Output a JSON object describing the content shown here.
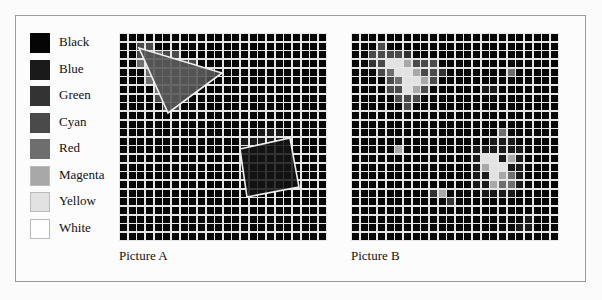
{
  "legend": {
    "items": [
      {
        "label": "Black",
        "color": "#050505"
      },
      {
        "label": "Blue",
        "color": "#1a1a1a"
      },
      {
        "label": "Green",
        "color": "#333333"
      },
      {
        "label": "Cyan",
        "color": "#4a4a4a"
      },
      {
        "label": "Red",
        "color": "#6e6e6e"
      },
      {
        "label": "Magenta",
        "color": "#a8a8a8"
      },
      {
        "label": "Yellow",
        "color": "#e2e2e2"
      },
      {
        "label": "White",
        "color": "#ffffff"
      }
    ]
  },
  "pictures": [
    {
      "caption": "Picture A",
      "grid": {
        "left": 119,
        "top": 33,
        "cols": 24,
        "rows": 24,
        "cell": 8.65,
        "line": "#e6e6e6",
        "background": "#050505"
      },
      "cells": [
        {
          "c": 2,
          "r": 1,
          "v": 3
        },
        {
          "c": 3,
          "r": 1,
          "v": 3
        },
        {
          "c": 2,
          "r": 2,
          "v": 3
        },
        {
          "c": 3,
          "r": 2,
          "v": 4
        },
        {
          "c": 4,
          "r": 2,
          "v": 4
        },
        {
          "c": 5,
          "r": 2,
          "v": 3
        },
        {
          "c": 6,
          "r": 2,
          "v": 3
        },
        {
          "c": 2,
          "r": 3,
          "v": 4
        },
        {
          "c": 3,
          "r": 3,
          "v": 4
        },
        {
          "c": 4,
          "r": 3,
          "v": 4
        },
        {
          "c": 5,
          "r": 3,
          "v": 4
        },
        {
          "c": 6,
          "r": 3,
          "v": 4
        },
        {
          "c": 7,
          "r": 3,
          "v": 3
        },
        {
          "c": 8,
          "r": 3,
          "v": 3
        },
        {
          "c": 3,
          "r": 4,
          "v": 4
        },
        {
          "c": 4,
          "r": 4,
          "v": 4
        },
        {
          "c": 5,
          "r": 4,
          "v": 4
        },
        {
          "c": 6,
          "r": 4,
          "v": 4
        },
        {
          "c": 7,
          "r": 4,
          "v": 4
        },
        {
          "c": 8,
          "r": 4,
          "v": 4
        },
        {
          "c": 9,
          "r": 4,
          "v": 4
        },
        {
          "c": 10,
          "r": 4,
          "v": 3
        },
        {
          "c": 3,
          "r": 5,
          "v": 4
        },
        {
          "c": 4,
          "r": 5,
          "v": 4
        },
        {
          "c": 5,
          "r": 5,
          "v": 4
        },
        {
          "c": 6,
          "r": 5,
          "v": 4
        },
        {
          "c": 7,
          "r": 5,
          "v": 4
        },
        {
          "c": 8,
          "r": 5,
          "v": 4
        },
        {
          "c": 9,
          "r": 5,
          "v": 3
        },
        {
          "c": 4,
          "r": 6,
          "v": 4
        },
        {
          "c": 5,
          "r": 6,
          "v": 4
        },
        {
          "c": 6,
          "r": 6,
          "v": 4
        },
        {
          "c": 7,
          "r": 6,
          "v": 4
        },
        {
          "c": 8,
          "r": 6,
          "v": 3
        },
        {
          "c": 4,
          "r": 7,
          "v": 3
        },
        {
          "c": 5,
          "r": 7,
          "v": 4
        },
        {
          "c": 6,
          "r": 7,
          "v": 4
        },
        {
          "c": 7,
          "r": 7,
          "v": 3
        },
        {
          "c": 5,
          "r": 8,
          "v": 3
        },
        {
          "c": 6,
          "r": 8,
          "v": 3
        },
        {
          "c": 16,
          "r": 11,
          "v": 1
        },
        {
          "c": 17,
          "r": 11,
          "v": 1
        },
        {
          "c": 18,
          "r": 11,
          "v": 1
        },
        {
          "c": 14,
          "r": 12,
          "v": 1
        },
        {
          "c": 15,
          "r": 12,
          "v": 1
        },
        {
          "c": 16,
          "r": 12,
          "v": 1
        },
        {
          "c": 17,
          "r": 12,
          "v": 1
        },
        {
          "c": 18,
          "r": 12,
          "v": 1
        },
        {
          "c": 19,
          "r": 12,
          "v": 1
        },
        {
          "c": 14,
          "r": 13,
          "v": 1
        },
        {
          "c": 15,
          "r": 13,
          "v": 1
        },
        {
          "c": 16,
          "r": 13,
          "v": 1
        },
        {
          "c": 17,
          "r": 13,
          "v": 1
        },
        {
          "c": 18,
          "r": 13,
          "v": 1
        },
        {
          "c": 19,
          "r": 13,
          "v": 1
        },
        {
          "c": 14,
          "r": 14,
          "v": 1
        },
        {
          "c": 15,
          "r": 14,
          "v": 1
        },
        {
          "c": 16,
          "r": 14,
          "v": 1
        },
        {
          "c": 17,
          "r": 14,
          "v": 1
        },
        {
          "c": 18,
          "r": 14,
          "v": 1
        },
        {
          "c": 19,
          "r": 14,
          "v": 1
        },
        {
          "c": 14,
          "r": 15,
          "v": 1
        },
        {
          "c": 15,
          "r": 15,
          "v": 1
        },
        {
          "c": 16,
          "r": 15,
          "v": 1
        },
        {
          "c": 17,
          "r": 15,
          "v": 1
        },
        {
          "c": 18,
          "r": 15,
          "v": 1
        },
        {
          "c": 19,
          "r": 15,
          "v": 1
        },
        {
          "c": 14,
          "r": 16,
          "v": 1
        },
        {
          "c": 15,
          "r": 16,
          "v": 1
        },
        {
          "c": 16,
          "r": 16,
          "v": 1
        },
        {
          "c": 17,
          "r": 16,
          "v": 1
        },
        {
          "c": 18,
          "r": 16,
          "v": 1
        },
        {
          "c": 19,
          "r": 16,
          "v": 1
        },
        {
          "c": 15,
          "r": 17,
          "v": 1
        },
        {
          "c": 16,
          "r": 17,
          "v": 1
        },
        {
          "c": 17,
          "r": 17,
          "v": 1
        },
        {
          "c": 18,
          "r": 17,
          "v": 1
        }
      ],
      "shapes": [
        {
          "type": "triangle",
          "points": [
            [
              20,
              48
            ],
            [
              222,
              73
            ],
            [
              168,
              113
            ]
          ],
          "fill": "#505050",
          "stroke": "#eeeeee"
        },
        {
          "type": "quad",
          "points": [
            [
              240,
              149
            ],
            [
              290,
              138
            ],
            [
              299,
              187
            ],
            [
              247,
              197
            ]
          ],
          "fill": "#121212",
          "stroke": "#eeeeee"
        }
      ]
    },
    {
      "caption": "Picture B",
      "grid": {
        "left": 351,
        "top": 33,
        "cols": 24,
        "rows": 24,
        "cell": 8.65,
        "line": "#e6e6e6",
        "background": "#050505"
      },
      "cells": [
        {
          "c": 3,
          "r": 1,
          "v": 3
        },
        {
          "c": 2,
          "r": 2,
          "v": 3
        },
        {
          "c": 3,
          "r": 2,
          "v": 3
        },
        {
          "c": 4,
          "r": 2,
          "v": 3
        },
        {
          "c": 5,
          "r": 2,
          "v": 3
        },
        {
          "c": 6,
          "r": 2,
          "v": 2
        },
        {
          "c": 2,
          "r": 3,
          "v": 2
        },
        {
          "c": 3,
          "r": 3,
          "v": 3
        },
        {
          "c": 4,
          "r": 3,
          "v": 6
        },
        {
          "c": 5,
          "r": 3,
          "v": 6
        },
        {
          "c": 6,
          "r": 3,
          "v": 5
        },
        {
          "c": 7,
          "r": 3,
          "v": 3
        },
        {
          "c": 8,
          "r": 3,
          "v": 3
        },
        {
          "c": 9,
          "r": 3,
          "v": 3
        },
        {
          "c": 3,
          "r": 4,
          "v": 3
        },
        {
          "c": 4,
          "r": 4,
          "v": 4
        },
        {
          "c": 5,
          "r": 4,
          "v": 6
        },
        {
          "c": 6,
          "r": 4,
          "v": 6
        },
        {
          "c": 7,
          "r": 4,
          "v": 5
        },
        {
          "c": 8,
          "r": 4,
          "v": 3
        },
        {
          "c": 9,
          "r": 4,
          "v": 3
        },
        {
          "c": 10,
          "r": 4,
          "v": 2
        },
        {
          "c": 4,
          "r": 5,
          "v": 3
        },
        {
          "c": 5,
          "r": 5,
          "v": 4
        },
        {
          "c": 6,
          "r": 5,
          "v": 6
        },
        {
          "c": 7,
          "r": 5,
          "v": 6
        },
        {
          "c": 8,
          "r": 5,
          "v": 5
        },
        {
          "c": 9,
          "r": 5,
          "v": 3
        },
        {
          "c": 4,
          "r": 6,
          "v": 3
        },
        {
          "c": 5,
          "r": 6,
          "v": 3
        },
        {
          "c": 6,
          "r": 6,
          "v": 6
        },
        {
          "c": 7,
          "r": 6,
          "v": 5
        },
        {
          "c": 8,
          "r": 6,
          "v": 3
        },
        {
          "c": 5,
          "r": 7,
          "v": 3
        },
        {
          "c": 6,
          "r": 7,
          "v": 3
        },
        {
          "c": 7,
          "r": 7,
          "v": 3
        },
        {
          "c": 6,
          "r": 8,
          "v": 3
        },
        {
          "c": 18,
          "r": 4,
          "v": 4
        },
        {
          "c": 15,
          "r": 6,
          "v": 1
        },
        {
          "c": 16,
          "r": 6,
          "v": 1
        },
        {
          "c": 17,
          "r": 11,
          "v": 4
        },
        {
          "c": 16,
          "r": 12,
          "v": 1
        },
        {
          "c": 17,
          "r": 12,
          "v": 1
        },
        {
          "c": 18,
          "r": 12,
          "v": 1
        },
        {
          "c": 14,
          "r": 13,
          "v": 1
        },
        {
          "c": 15,
          "r": 13,
          "v": 1
        },
        {
          "c": 16,
          "r": 13,
          "v": 1
        },
        {
          "c": 17,
          "r": 13,
          "v": 1
        },
        {
          "c": 18,
          "r": 13,
          "v": 1
        },
        {
          "c": 19,
          "r": 13,
          "v": 1
        },
        {
          "c": 14,
          "r": 14,
          "v": 1
        },
        {
          "c": 15,
          "r": 14,
          "v": 6
        },
        {
          "c": 16,
          "r": 14,
          "v": 6
        },
        {
          "c": 17,
          "r": 14,
          "v": 1
        },
        {
          "c": 18,
          "r": 14,
          "v": 5
        },
        {
          "c": 19,
          "r": 14,
          "v": 1
        },
        {
          "c": 14,
          "r": 15,
          "v": 1
        },
        {
          "c": 15,
          "r": 15,
          "v": 5
        },
        {
          "c": 16,
          "r": 15,
          "v": 6
        },
        {
          "c": 17,
          "r": 15,
          "v": 6
        },
        {
          "c": 18,
          "r": 15,
          "v": 1
        },
        {
          "c": 19,
          "r": 15,
          "v": 1
        },
        {
          "c": 14,
          "r": 16,
          "v": 1
        },
        {
          "c": 15,
          "r": 16,
          "v": 1
        },
        {
          "c": 16,
          "r": 16,
          "v": 6
        },
        {
          "c": 17,
          "r": 16,
          "v": 5
        },
        {
          "c": 18,
          "r": 16,
          "v": 4
        },
        {
          "c": 19,
          "r": 16,
          "v": 1
        },
        {
          "c": 14,
          "r": 17,
          "v": 1
        },
        {
          "c": 15,
          "r": 17,
          "v": 1
        },
        {
          "c": 16,
          "r": 17,
          "v": 5
        },
        {
          "c": 17,
          "r": 17,
          "v": 4
        },
        {
          "c": 18,
          "r": 17,
          "v": 4
        },
        {
          "c": 19,
          "r": 17,
          "v": 1
        },
        {
          "c": 15,
          "r": 18,
          "v": 1
        },
        {
          "c": 16,
          "r": 18,
          "v": 1
        },
        {
          "c": 17,
          "r": 18,
          "v": 1
        },
        {
          "c": 18,
          "r": 18,
          "v": 1
        },
        {
          "c": 5,
          "r": 13,
          "v": 5
        },
        {
          "c": 9,
          "r": 18,
          "v": 2
        },
        {
          "c": 10,
          "r": 18,
          "v": 5
        },
        {
          "c": 11,
          "r": 19,
          "v": 2
        },
        {
          "c": 20,
          "r": 21,
          "v": 1
        },
        {
          "c": 19,
          "r": 22,
          "v": 1
        },
        {
          "c": 20,
          "r": 22,
          "v": 1
        }
      ],
      "shapes": []
    }
  ]
}
